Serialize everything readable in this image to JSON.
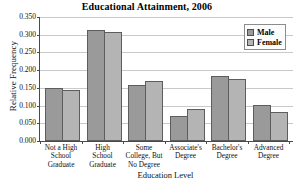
{
  "chart_data": {
    "type": "bar",
    "title": "Educational Attainment, 2006",
    "xlabel": "Education Level",
    "ylabel": "Relative Frequency",
    "categories": [
      "Not a High School Graduate",
      "High School Graduate",
      "Some College, But No Degree",
      "Associate's Degree",
      "Bachelor's Degree",
      "Advanced Degree"
    ],
    "category_lines": [
      [
        "Not a High",
        "School",
        "Graduate"
      ],
      [
        "High",
        "School",
        "Graduate"
      ],
      [
        "Some",
        "College, But",
        "No Degree"
      ],
      [
        "Associate's",
        "Degree"
      ],
      [
        "Bachelor's",
        "Degree"
      ],
      [
        "Advanced",
        "Degree"
      ]
    ],
    "series": [
      {
        "name": "Male",
        "color": "#9a9a9a",
        "values": [
          0.151,
          0.313,
          0.158,
          0.07,
          0.184,
          0.101
        ]
      },
      {
        "name": "Female",
        "color": "#b4b4b4",
        "values": [
          0.143,
          0.309,
          0.168,
          0.09,
          0.176,
          0.081
        ]
      }
    ],
    "ylim": [
      0.0,
      0.35
    ],
    "ytick_labels": [
      "0.000",
      "0.050",
      "0.100",
      "0.150",
      "0.200",
      "0.250",
      "0.300",
      "0.350"
    ],
    "ytick_values": [
      0.0,
      0.05,
      0.1,
      0.15,
      0.2,
      0.25,
      0.3,
      0.35
    ],
    "grid": true,
    "legend_position": "top-right"
  }
}
